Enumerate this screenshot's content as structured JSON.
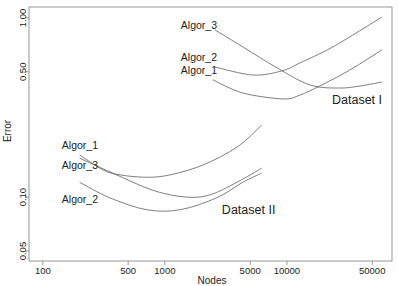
{
  "chart_data": {
    "type": "line",
    "title": "",
    "xlabel": "Nodes",
    "ylabel": "Error",
    "xscale": "log",
    "yscale": "log",
    "xlim": [
      77,
      72600
    ],
    "ylim": [
      0.044,
      1.15
    ],
    "grid": false,
    "legend": null,
    "xticks": [
      100,
      500,
      1000,
      5000,
      10000,
      50000
    ],
    "xtick_labels": [
      "100",
      "500",
      "1000",
      "5000",
      "10000",
      "50000"
    ],
    "yticks": [
      0.05,
      0.1,
      0.5,
      1.0
    ],
    "ytick_labels": [
      "0.05",
      "0.10",
      "0.50",
      "1.00"
    ],
    "series": [
      {
        "name": "Algor_1",
        "group": "Dataset I",
        "x": [
          2470,
          4350,
          9300,
          12800,
          18600,
          32800,
          60000
        ],
        "y": [
          0.451,
          0.381,
          0.353,
          0.371,
          0.417,
          0.512,
          0.663
        ]
      },
      {
        "name": "Algor_2",
        "group": "Dataset I",
        "x": [
          2570,
          5250,
          9100,
          12800,
          23800,
          60000
        ],
        "y": [
          0.532,
          0.48,
          0.506,
          0.561,
          0.689,
          1.01
        ]
      },
      {
        "name": "Algor_3",
        "group": "Dataset I",
        "x": [
          2570,
          4350,
          8300,
          15500,
          27000,
          40000,
          60000
        ],
        "y": [
          0.857,
          0.689,
          0.526,
          0.422,
          0.406,
          0.417,
          0.439
        ]
      },
      {
        "name": "Algor_1",
        "group": "Dataset II",
        "x": [
          200,
          310,
          430,
          710,
          1100,
          2050,
          3900,
          6200
        ],
        "y": [
          0.172,
          0.142,
          0.133,
          0.129,
          0.133,
          0.151,
          0.19,
          0.252
        ]
      },
      {
        "name": "Algor_2",
        "group": "Dataset II",
        "x": [
          200,
          355,
          710,
          1330,
          2650,
          4350,
          6200
        ],
        "y": [
          0.121,
          0.099,
          0.085,
          0.085,
          0.099,
          0.121,
          0.136
        ]
      },
      {
        "name": "Algor_3",
        "group": "Dataset II",
        "x": [
          200,
          375,
          800,
          1500,
          2350,
          3900,
          6200
        ],
        "y": [
          0.165,
          0.136,
          0.109,
          0.1,
          0.103,
          0.121,
          0.145
        ]
      }
    ],
    "annotations": [
      {
        "text": "Algor_3",
        "kind": "curve",
        "x": 1350,
        "y": 0.868
      },
      {
        "text": "Algor_2",
        "kind": "curve",
        "x": 1350,
        "y": 0.575
      },
      {
        "text": "Algor_1",
        "kind": "curve",
        "x": 1350,
        "y": 0.486
      },
      {
        "text": "Dataset I",
        "kind": "group",
        "x": 23400,
        "y": 0.331
      },
      {
        "text": "Algor_1",
        "kind": "curve",
        "x": 143,
        "y": 0.185
      },
      {
        "text": "Algor_3",
        "kind": "curve",
        "x": 143,
        "y": 0.143
      },
      {
        "text": "Algor_2",
        "kind": "curve",
        "x": 143,
        "y": 0.0925
      },
      {
        "text": "Dataset II",
        "kind": "group",
        "x": 2930,
        "y": 0.0804
      }
    ]
  }
}
